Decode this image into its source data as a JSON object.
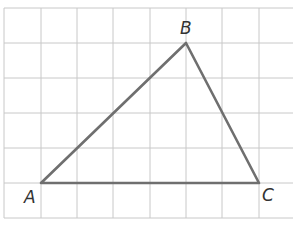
{
  "diagram": {
    "type": "triangle-on-grid",
    "grid": {
      "x_lines": [
        4,
        41,
        77,
        113,
        150,
        186,
        222,
        259
      ],
      "y_lines": [
        8,
        43,
        78,
        113,
        148,
        183,
        218
      ],
      "right_edge": 293,
      "color": "#c8c8c8"
    },
    "edge_color": "#6f6f6f",
    "vertices": [
      {
        "name": "A",
        "label": "A",
        "x": 41,
        "y": 183,
        "label_x": 24,
        "label_y": 203
      },
      {
        "name": "B",
        "label": "B",
        "x": 186,
        "y": 43,
        "label_x": 180,
        "label_y": 34
      },
      {
        "name": "C",
        "label": "C",
        "x": 259,
        "y": 183,
        "label_x": 262,
        "label_y": 201
      }
    ]
  }
}
